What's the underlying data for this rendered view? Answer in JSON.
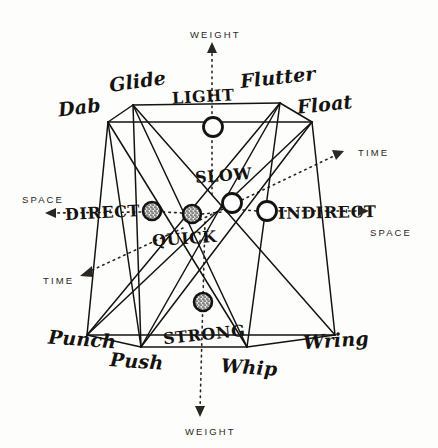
{
  "figure": {
    "type": "diagram",
    "background_color": "#fdfdfc",
    "ink_color": "#15130f"
  },
  "axes": [
    {
      "id": "weight-up",
      "label": "WEIGHT",
      "direction": "up",
      "arrow": "▲",
      "x": 190,
      "y": 30,
      "style": "dotted"
    },
    {
      "id": "weight-down",
      "label": "WEIGHT",
      "direction": "down",
      "arrow": "▼",
      "x": 185,
      "y": 427,
      "style": "dotted"
    },
    {
      "id": "space-left",
      "label": "SPACE",
      "direction": "left",
      "arrow": "◀",
      "x": 22,
      "y": 195,
      "style": "dotted"
    },
    {
      "id": "space-right",
      "label": "SPACE",
      "direction": "right",
      "arrow": "▶",
      "x": 370,
      "y": 228,
      "style": "dotted"
    },
    {
      "id": "time-upright",
      "label": "TIME",
      "direction": "up-right",
      "arrow": "▶",
      "x": 358,
      "y": 148,
      "style": "dotted"
    },
    {
      "id": "time-downleft",
      "label": "TIME",
      "direction": "down-left",
      "arrow": "◀",
      "x": 43,
      "y": 276,
      "style": "dotted"
    }
  ],
  "poles": [
    {
      "id": "light",
      "label": "LIGHT",
      "node": "open",
      "node_x": 213,
      "node_y": 127,
      "label_x": 172,
      "label_y": 89
    },
    {
      "id": "strong",
      "label": "STRONG",
      "node": "stippled",
      "node_x": 203,
      "node_y": 302,
      "label_x": 163,
      "label_y": 327
    },
    {
      "id": "direct",
      "label": "DIRECT",
      "node": "stippled",
      "node_x": 152,
      "node_y": 211,
      "label_x": 65,
      "label_y": 205
    },
    {
      "id": "indirect",
      "label": "INDIRECT",
      "node": "open",
      "node_x": 267,
      "node_y": 211,
      "label_x": 278,
      "label_y": 205
    },
    {
      "id": "slow",
      "label": "SLOW",
      "node": "open",
      "node_x": 232,
      "node_y": 203,
      "label_x": 195,
      "label_y": 168
    },
    {
      "id": "quick",
      "label": "QUICK",
      "node": "stippled",
      "node_x": 192,
      "node_y": 214,
      "label_x": 152,
      "label_y": 231
    }
  ],
  "actions": [
    {
      "id": "glide",
      "label": "Glide",
      "vertex_x": 133,
      "vertex_y": 105,
      "label_x": 109,
      "label_y": 72,
      "rotate": -8
    },
    {
      "id": "dab",
      "label": "Dab",
      "vertex_x": 108,
      "vertex_y": 122,
      "label_x": 58,
      "label_y": 98,
      "rotate": -7
    },
    {
      "id": "flutter",
      "label": "Flutter",
      "vertex_x": 280,
      "vertex_y": 103,
      "label_x": 240,
      "label_y": 68,
      "rotate": -6
    },
    {
      "id": "float",
      "label": "Float",
      "vertex_x": 312,
      "vertex_y": 122,
      "label_x": 297,
      "label_y": 95,
      "rotate": -6
    },
    {
      "id": "punch",
      "label": "Punch",
      "vertex_x": 87,
      "vertex_y": 335,
      "label_x": 48,
      "label_y": 330,
      "rotate": 4
    },
    {
      "id": "push",
      "label": "Push",
      "vertex_x": 141,
      "vertex_y": 347,
      "label_x": 110,
      "label_y": 352,
      "rotate": 4
    },
    {
      "id": "whip",
      "label": "Whip",
      "vertex_x": 247,
      "vertex_y": 347,
      "label_x": 221,
      "label_y": 358,
      "rotate": 4
    },
    {
      "id": "wring",
      "label": "Wring",
      "vertex_x": 335,
      "vertex_y": 335,
      "label_x": 303,
      "label_y": 331,
      "rotate": -4
    }
  ],
  "edges": [
    [
      "glide",
      "dab"
    ],
    [
      "glide",
      "flutter"
    ],
    [
      "flutter",
      "float"
    ],
    [
      "dab",
      "float"
    ],
    [
      "punch",
      "push"
    ],
    [
      "push",
      "whip"
    ],
    [
      "whip",
      "wring"
    ],
    [
      "punch",
      "wring"
    ],
    [
      "glide",
      "wring"
    ],
    [
      "glide",
      "whip"
    ],
    [
      "glide",
      "push"
    ],
    [
      "dab",
      "punch"
    ],
    [
      "dab",
      "whip"
    ],
    [
      "dab",
      "push"
    ],
    [
      "flutter",
      "punch"
    ],
    [
      "flutter",
      "push"
    ],
    [
      "flutter",
      "whip"
    ],
    [
      "float",
      "punch"
    ],
    [
      "float",
      "push"
    ],
    [
      "float",
      "wring"
    ]
  ]
}
